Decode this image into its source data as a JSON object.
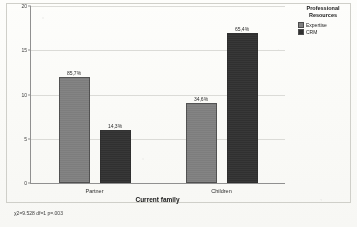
{
  "chart_data": {
    "type": "bar",
    "title": "",
    "xlabel": "Current family",
    "ylabel": "",
    "categories": [
      "Partner",
      "Children"
    ],
    "ylim": [
      0,
      20
    ],
    "yticks": [
      0,
      5,
      10,
      15,
      20
    ],
    "ytick_labels": [
      "0",
      "5",
      "10",
      "15",
      "20"
    ],
    "grid": true,
    "legend_position": "right",
    "legend_title": "Professional Resources",
    "series": [
      {
        "name": "Expertise",
        "color": "#7e7e7e",
        "values": [
          12,
          9
        ],
        "data_labels": [
          "85,7%",
          "34,6%"
        ]
      },
      {
        "name": "CRM",
        "color": "#2e2e2e",
        "values": [
          6,
          17
        ],
        "data_labels": [
          "14,3%",
          "65,4%"
        ]
      }
    ],
    "annotation": "χ2=9.528  df=1  p=.003"
  },
  "legend": {
    "title_line1": "Professional",
    "title_line2": "Resources",
    "items": [
      {
        "label": "Expertise",
        "swatch": "expertise-swatch-icon"
      },
      {
        "label": "CRM",
        "swatch": "crm-swatch-icon"
      }
    ]
  },
  "axis": {
    "x_title": "Current family"
  },
  "footnote": {
    "text": "χ2=9.528  df=1  p=.003"
  }
}
